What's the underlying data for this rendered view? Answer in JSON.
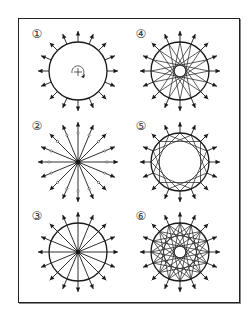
{
  "figure": {
    "stroke_color": "#1a1a1a",
    "background": "#ffffff",
    "spoke_count": 16,
    "panels": [
      {
        "id": 1,
        "label": "1",
        "variant": "circle-rotation",
        "cx": 78,
        "cy": 71,
        "r": 29
      },
      {
        "id": 2,
        "label": "2",
        "variant": "radial-spokes",
        "cx": 78,
        "cy": 162,
        "r": 29
      },
      {
        "id": 3,
        "label": "3",
        "variant": "circle-spokes",
        "cx": 78,
        "cy": 252,
        "r": 29
      },
      {
        "id": 4,
        "label": "4",
        "variant": "star-skip-7",
        "cx": 180,
        "cy": 71,
        "r": 29
      },
      {
        "id": 5,
        "label": "5",
        "variant": "star-skip-4",
        "cx": 180,
        "cy": 162,
        "r": 29
      },
      {
        "id": 6,
        "label": "6",
        "variant": "star-skip-5-7",
        "cx": 180,
        "cy": 252,
        "r": 29
      }
    ],
    "labels": [
      {
        "text": "①",
        "x": 31,
        "y": 28
      },
      {
        "text": "④",
        "x": 135,
        "y": 28
      },
      {
        "text": "②",
        "x": 31,
        "y": 120
      },
      {
        "text": "⑤",
        "x": 135,
        "y": 120
      },
      {
        "text": "③",
        "x": 31,
        "y": 210
      },
      {
        "text": "⑥",
        "x": 135,
        "y": 210
      }
    ]
  }
}
